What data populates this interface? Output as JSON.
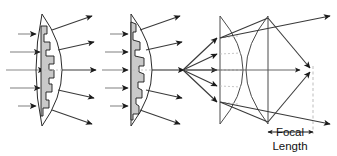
{
  "figure": {
    "title_visible": false,
    "background_color": "#ffffff",
    "panels": [
      {
        "id": "panel-1",
        "name": "stepped-biconvex-lens-panel",
        "lens_type": "stepped biconvex fresnel lens",
        "fill_color": "#c9c9c9",
        "outline_color": "#2b2b2b",
        "incoming_ray_count": 5,
        "outgoing_ray_count": 5,
        "rays_diverge": true
      },
      {
        "id": "panel-2",
        "name": "stepped-planoconvex-lens-panel",
        "lens_type": "stepped plano-convex fresnel lens",
        "fill_color": "#c9c9c9",
        "outline_color": "#2b2b2b",
        "incoming_ray_count": 5,
        "outgoing_ray_count": 5,
        "rays_diverge": true
      },
      {
        "id": "panel-3",
        "name": "two-element-lens-focusing-panel",
        "lens_type": "concave plus convex compound lens",
        "outline_color": "#4a4a4a",
        "incoming_ray_count": 5,
        "outgoing_ray_count": 5,
        "rays_converge": true,
        "has_point_source": true,
        "has_focal_point": true
      }
    ],
    "annotation": {
      "name": "focal-length-dimension",
      "label_line_1": "Focal",
      "label_line_2": "Length",
      "marker_style": "double-headed arrow",
      "guide_line_style": "dashed vertical"
    },
    "colors": {
      "incoming_ray": "#8a8a8a",
      "outgoing_ray": "#3a3a3a",
      "arrowhead": "#1a1a1a",
      "lens_fill": "#c9c9c9",
      "dashed_guide": "#bdbdbd",
      "text": "#111111"
    }
  }
}
